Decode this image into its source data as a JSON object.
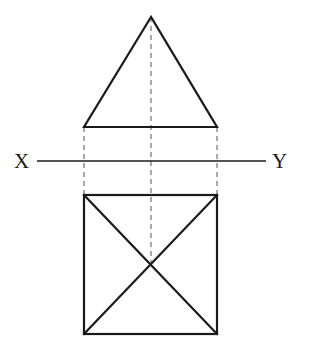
{
  "diagram": {
    "type": "orthographic-projection",
    "labels": {
      "x": "X",
      "y": "Y"
    },
    "colors": {
      "line": "#1a1a1a",
      "projector": "#555555",
      "background": "#ffffff"
    },
    "front_view": {
      "shape": "triangle",
      "apex": [
        151,
        17
      ],
      "base_left": [
        84,
        127
      ],
      "base_right": [
        217,
        127
      ]
    },
    "reference_line": {
      "from": [
        37,
        161
      ],
      "to": [
        266,
        161
      ]
    },
    "top_view": {
      "shape": "square-with-diagonals",
      "top_left": [
        84,
        195
      ],
      "bottom_right": [
        217,
        334
      ],
      "center": [
        151,
        264
      ]
    },
    "projectors": [
      {
        "from": [
          84,
          127
        ],
        "to": [
          84,
          195
        ]
      },
      {
        "from": [
          151,
          17
        ],
        "to": [
          151,
          264
        ]
      },
      {
        "from": [
          217,
          127
        ],
        "to": [
          217,
          195
        ]
      }
    ]
  }
}
